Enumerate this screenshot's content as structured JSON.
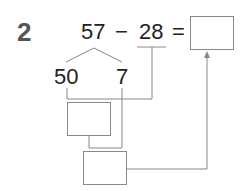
{
  "problem": {
    "number": "2",
    "expression": {
      "minuend": "57",
      "operator": "−",
      "subtrahend": "28",
      "equals": "="
    },
    "decomposition": {
      "tens": "50",
      "ones": "7"
    },
    "answer_box": "",
    "step_box_1": "",
    "step_box_2": ""
  },
  "colors": {
    "text": "#222222",
    "lines": "#888888",
    "number_label": "#555555"
  }
}
